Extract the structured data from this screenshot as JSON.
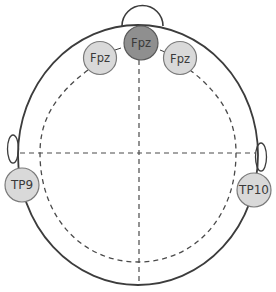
{
  "diagram": {
    "colors": {
      "outline": "#3c3c3c",
      "dashed": "#4a4a4a",
      "electrode_fill": "#d9d9d9",
      "electrode_fill_active": "#8f8f8f",
      "electrode_stroke": "#7a7a7a",
      "label": "#3a3a3a"
    },
    "electrodes": [
      {
        "id": "fpz-left",
        "label": "Fpz",
        "active": false
      },
      {
        "id": "fpz-center",
        "label": "Fpz",
        "active": true
      },
      {
        "id": "fpz-right",
        "label": "Fpz",
        "active": false
      },
      {
        "id": "tp9",
        "label": "TP9",
        "active": false
      },
      {
        "id": "tp10",
        "label": "TP10",
        "active": false
      }
    ],
    "features": [
      "nose",
      "left-ear",
      "right-ear",
      "midline",
      "coronal-line",
      "inner-circumference"
    ]
  }
}
